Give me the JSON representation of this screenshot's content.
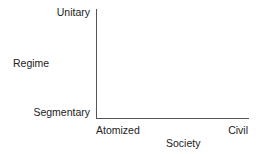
{
  "diagram": {
    "title_partial": "",
    "y_axis": {
      "title": "Regime",
      "top_label": "Unitary",
      "bottom_label": "Segmentary"
    },
    "x_axis": {
      "title": "Society",
      "left_label": "Atomized",
      "right_label": "Civil"
    },
    "colors": {
      "axis": "#555555",
      "text": "#222222",
      "background": "#ffffff"
    }
  }
}
